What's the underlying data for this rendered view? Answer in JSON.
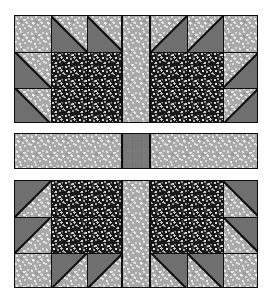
{
  "artwork": {
    "title": "Quilt Block Layout",
    "kind": "quilt-block-diagram",
    "arrangement": "2x2 blocks with sashing and center cornerstone",
    "canvas": {
      "width": 273,
      "height": 305,
      "background": "#ffffff"
    }
  },
  "fabrics": [
    {
      "id": "light",
      "name": "light-speckled-grey",
      "color": "#a9a9a9",
      "speck_color": "#e6e6e6"
    },
    {
      "id": "dark",
      "name": "dark-speckled-black",
      "color": "#191919",
      "speck_color": "#d6d6d6"
    },
    {
      "id": "medium",
      "name": "medium-solid-grey",
      "color": "#6f6f6f",
      "speck_color": "#787878"
    }
  ],
  "seam": {
    "color": "#0d0d0d",
    "width": 1
  },
  "grid": {
    "block_size": 108,
    "unit_size": 36,
    "sash_thickness": 36,
    "columns": [
      {
        "x": 14,
        "w": 108
      },
      {
        "x": 122,
        "w": 28
      },
      {
        "x": 150,
        "w": 108
      }
    ],
    "rows": [
      {
        "y": 15,
        "h": 108
      },
      {
        "y": 133,
        "h": 36
      },
      {
        "y": 180,
        "h": 108
      }
    ]
  },
  "blocks": [
    {
      "id": "block-top-left",
      "name": "Top-left block",
      "rotation_deg": 0,
      "dark_quadrant": "bottom-right",
      "triangle_points": "up-left",
      "units": [
        {
          "row": 0,
          "col": 0,
          "fabric": "light",
          "shape": "square"
        },
        {
          "row": 0,
          "col": 1,
          "fabric": "light",
          "shape": "hst",
          "hst_corner": "bottom-left"
        },
        {
          "row": 0,
          "col": 2,
          "fabric": "light",
          "shape": "hst",
          "hst_corner": "bottom-left"
        },
        {
          "row": 1,
          "col": 0,
          "fabric": "light",
          "shape": "hst",
          "hst_corner": "bottom-left"
        },
        {
          "row": 1,
          "col": 1,
          "fabric": "dark",
          "shape": "square"
        },
        {
          "row": 1,
          "col": 2,
          "fabric": "dark",
          "shape": "square"
        },
        {
          "row": 2,
          "col": 0,
          "fabric": "light",
          "shape": "hst",
          "hst_corner": "bottom-left"
        },
        {
          "row": 2,
          "col": 1,
          "fabric": "dark",
          "shape": "square"
        },
        {
          "row": 2,
          "col": 2,
          "fabric": "dark",
          "shape": "square"
        }
      ]
    },
    {
      "id": "block-top-right",
      "name": "Top-right block",
      "rotation_deg": 90,
      "dark_quadrant": "bottom-left",
      "triangle_points": "up-right",
      "units": [
        {
          "row": 0,
          "col": 0,
          "fabric": "light",
          "shape": "hst",
          "hst_corner": "bottom-right"
        },
        {
          "row": 0,
          "col": 1,
          "fabric": "light",
          "shape": "hst",
          "hst_corner": "bottom-right"
        },
        {
          "row": 0,
          "col": 2,
          "fabric": "light",
          "shape": "square"
        },
        {
          "row": 1,
          "col": 0,
          "fabric": "dark",
          "shape": "square"
        },
        {
          "row": 1,
          "col": 1,
          "fabric": "dark",
          "shape": "square"
        },
        {
          "row": 1,
          "col": 2,
          "fabric": "light",
          "shape": "hst",
          "hst_corner": "bottom-right"
        },
        {
          "row": 2,
          "col": 0,
          "fabric": "dark",
          "shape": "square"
        },
        {
          "row": 2,
          "col": 1,
          "fabric": "dark",
          "shape": "square"
        },
        {
          "row": 2,
          "col": 2,
          "fabric": "light",
          "shape": "hst",
          "hst_corner": "bottom-right"
        }
      ]
    },
    {
      "id": "block-bottom-left",
      "name": "Bottom-left block",
      "rotation_deg": 270,
      "dark_quadrant": "top-right",
      "triangle_points": "down-left",
      "units": [
        {
          "row": 0,
          "col": 0,
          "fabric": "light",
          "shape": "hst",
          "hst_corner": "top-left"
        },
        {
          "row": 0,
          "col": 1,
          "fabric": "dark",
          "shape": "square"
        },
        {
          "row": 0,
          "col": 2,
          "fabric": "dark",
          "shape": "square"
        },
        {
          "row": 1,
          "col": 0,
          "fabric": "light",
          "shape": "hst",
          "hst_corner": "top-left"
        },
        {
          "row": 1,
          "col": 1,
          "fabric": "dark",
          "shape": "square"
        },
        {
          "row": 1,
          "col": 2,
          "fabric": "dark",
          "shape": "square"
        },
        {
          "row": 2,
          "col": 0,
          "fabric": "light",
          "shape": "square"
        },
        {
          "row": 2,
          "col": 1,
          "fabric": "light",
          "shape": "hst",
          "hst_corner": "top-left"
        },
        {
          "row": 2,
          "col": 2,
          "fabric": "light",
          "shape": "hst",
          "hst_corner": "top-left"
        }
      ]
    },
    {
      "id": "block-bottom-right",
      "name": "Bottom-right block",
      "rotation_deg": 180,
      "dark_quadrant": "top-left",
      "triangle_points": "down-right",
      "units": [
        {
          "row": 0,
          "col": 0,
          "fabric": "dark",
          "shape": "square"
        },
        {
          "row": 0,
          "col": 1,
          "fabric": "dark",
          "shape": "square"
        },
        {
          "row": 0,
          "col": 2,
          "fabric": "light",
          "shape": "hst",
          "hst_corner": "top-right"
        },
        {
          "row": 1,
          "col": 0,
          "fabric": "dark",
          "shape": "square"
        },
        {
          "row": 1,
          "col": 1,
          "fabric": "dark",
          "shape": "square"
        },
        {
          "row": 1,
          "col": 2,
          "fabric": "light",
          "shape": "hst",
          "hst_corner": "top-right"
        },
        {
          "row": 2,
          "col": 0,
          "fabric": "light",
          "shape": "hst",
          "hst_corner": "top-right"
        },
        {
          "row": 2,
          "col": 1,
          "fabric": "light",
          "shape": "hst",
          "hst_corner": "top-right"
        },
        {
          "row": 2,
          "col": 2,
          "fabric": "light",
          "shape": "square"
        }
      ]
    }
  ],
  "sashing": [
    {
      "id": "sash-top-vertical",
      "name": "Top vertical sashing",
      "fabric": "light",
      "x": 122,
      "y": 15,
      "w": 28,
      "h": 108
    },
    {
      "id": "sash-bottom-vertical",
      "name": "Bottom vertical sashing",
      "fabric": "light",
      "x": 122,
      "y": 180,
      "w": 28,
      "h": 108
    },
    {
      "id": "sash-left-horizontal",
      "name": "Left horizontal sashing",
      "fabric": "light",
      "x": 14,
      "y": 133,
      "w": 108,
      "h": 36
    },
    {
      "id": "sash-right-horizontal",
      "name": "Right horizontal sashing",
      "fabric": "light",
      "x": 150,
      "y": 133,
      "w": 108,
      "h": 36
    }
  ],
  "cornerstone": {
    "id": "center-cornerstone",
    "name": "Center cornerstone square",
    "fabric": "medium",
    "x": 122,
    "y": 133,
    "w": 28,
    "h": 36
  }
}
